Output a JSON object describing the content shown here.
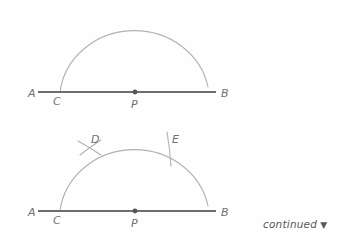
{
  "figure": {
    "colors": {
      "background": "#fefefe",
      "line": "#6d6d70",
      "arc": "#b2b2b6",
      "label": "#6f6f72",
      "point": "#55555a",
      "note": "#58585b"
    },
    "panels": [
      {
        "name": "step-1",
        "line": {
          "name": "line-AB",
          "x1": 38,
          "y1": 92,
          "x2": 216,
          "y2": 92
        },
        "arc": {
          "name": "semicircle-arc",
          "cx": 135,
          "cy": 92,
          "rx": 75,
          "ry": 70
        },
        "point": {
          "name": "point-P",
          "cx": 135,
          "cy": 92,
          "r": 2.4
        },
        "labels": [
          {
            "name": "label-A",
            "text": "A",
            "x": 28,
            "y": 97
          },
          {
            "name": "label-C",
            "text": "C",
            "x": 53,
            "y": 105
          },
          {
            "name": "label-P",
            "text": "P",
            "x": 131,
            "y": 108
          },
          {
            "name": "label-B",
            "text": "B",
            "x": 221,
            "y": 97
          }
        ]
      },
      {
        "name": "step-2",
        "line": {
          "name": "line-AB",
          "x1": 38,
          "y1": 211,
          "x2": 216,
          "y2": 211
        },
        "arc": {
          "name": "semicircle-arc",
          "cx": 135,
          "cy": 211,
          "rx": 75,
          "ry": 70
        },
        "point": {
          "name": "point-P",
          "cx": 135,
          "cy": 211,
          "r": 2.4
        },
        "labels": [
          {
            "name": "label-A",
            "text": "A",
            "x": 28,
            "y": 216
          },
          {
            "name": "label-C",
            "text": "C",
            "x": 53,
            "y": 224
          },
          {
            "name": "label-P",
            "text": "P",
            "x": 131,
            "y": 227
          },
          {
            "name": "label-B",
            "text": "B",
            "x": 221,
            "y": 216
          },
          {
            "name": "label-D",
            "text": "D",
            "x": 91,
            "y": 143
          },
          {
            "name": "label-E",
            "text": "E",
            "x": 172,
            "y": 143
          }
        ],
        "marks": [
          {
            "name": "cross-mark-D",
            "type": "x-cross"
          },
          {
            "name": "tick-mark-E",
            "type": "tick"
          }
        ]
      }
    ]
  },
  "note": {
    "text": "continued",
    "arrow": "▼",
    "x": 263,
    "y": 218
  }
}
